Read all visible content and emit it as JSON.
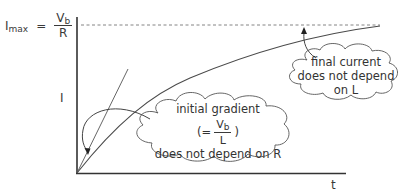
{
  "diagram": {
    "title": "",
    "formula": {
      "lhs": "I",
      "lhs_sub": "max",
      "equals": "=",
      "num": "V",
      "num_sub": "b",
      "den": "R"
    },
    "y_axis_label": "I",
    "x_axis_label": "t",
    "notes": {
      "initial": {
        "line1": "initial gradient",
        "paren_open": "(=",
        "num": "V",
        "num_sub": "b",
        "den": "L",
        "paren_close": ")",
        "line3": "does not depend on R"
      },
      "final": {
        "line1": "final current",
        "line2": "does not depend",
        "line3": "on L"
      }
    },
    "colors": {
      "line": "#4a4a4a",
      "axis": "#333333",
      "text": "#3a3a3a",
      "background": "#ffffff"
    }
  }
}
